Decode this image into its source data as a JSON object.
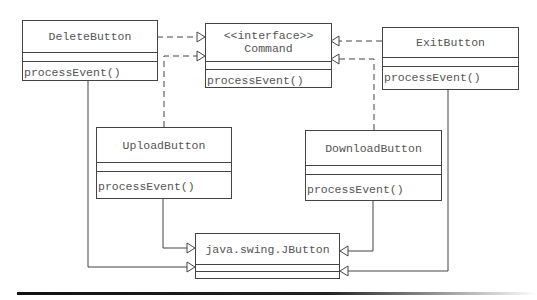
{
  "diagram": {
    "type": "UML class diagram",
    "classes": [
      {
        "id": "delete",
        "name": "DeleteButton",
        "methods": [
          "processEvent()"
        ]
      },
      {
        "id": "command",
        "stereotype": "<<interface>>",
        "name": "Command",
        "methods": [
          "processEvent()"
        ]
      },
      {
        "id": "exit",
        "name": "ExitButton",
        "methods": [
          "processEvent()"
        ]
      },
      {
        "id": "upload",
        "name": "UploadButton",
        "methods": [
          "processEvent()"
        ]
      },
      {
        "id": "download",
        "name": "DownloadButton",
        "methods": [
          "processEvent()"
        ]
      },
      {
        "id": "jbutton",
        "name": "java.swing.JButton",
        "methods": []
      }
    ],
    "relations": [
      {
        "from": "DeleteButton",
        "to": "Command",
        "kind": "realization (dashed, hollow triangle)"
      },
      {
        "from": "UploadButton",
        "to": "Command",
        "kind": "realization (dashed, hollow triangle)"
      },
      {
        "from": "ExitButton",
        "to": "Command",
        "kind": "realization (dashed, hollow triangle)"
      },
      {
        "from": "DownloadButton",
        "to": "Command",
        "kind": "realization (dashed, hollow triangle)"
      },
      {
        "from": "DeleteButton",
        "to": "java.swing.JButton",
        "kind": "generalization (solid, hollow triangle)"
      },
      {
        "from": "UploadButton",
        "to": "java.swing.JButton",
        "kind": "generalization (solid, hollow triangle)"
      },
      {
        "from": "ExitButton",
        "to": "java.swing.JButton",
        "kind": "generalization (solid, hollow triangle)"
      },
      {
        "from": "DownloadButton",
        "to": "java.swing.JButton",
        "kind": "generalization (solid, hollow triangle)"
      }
    ]
  },
  "colors": {
    "line": "#444444",
    "text": "#555555",
    "background": "#ffffff"
  }
}
